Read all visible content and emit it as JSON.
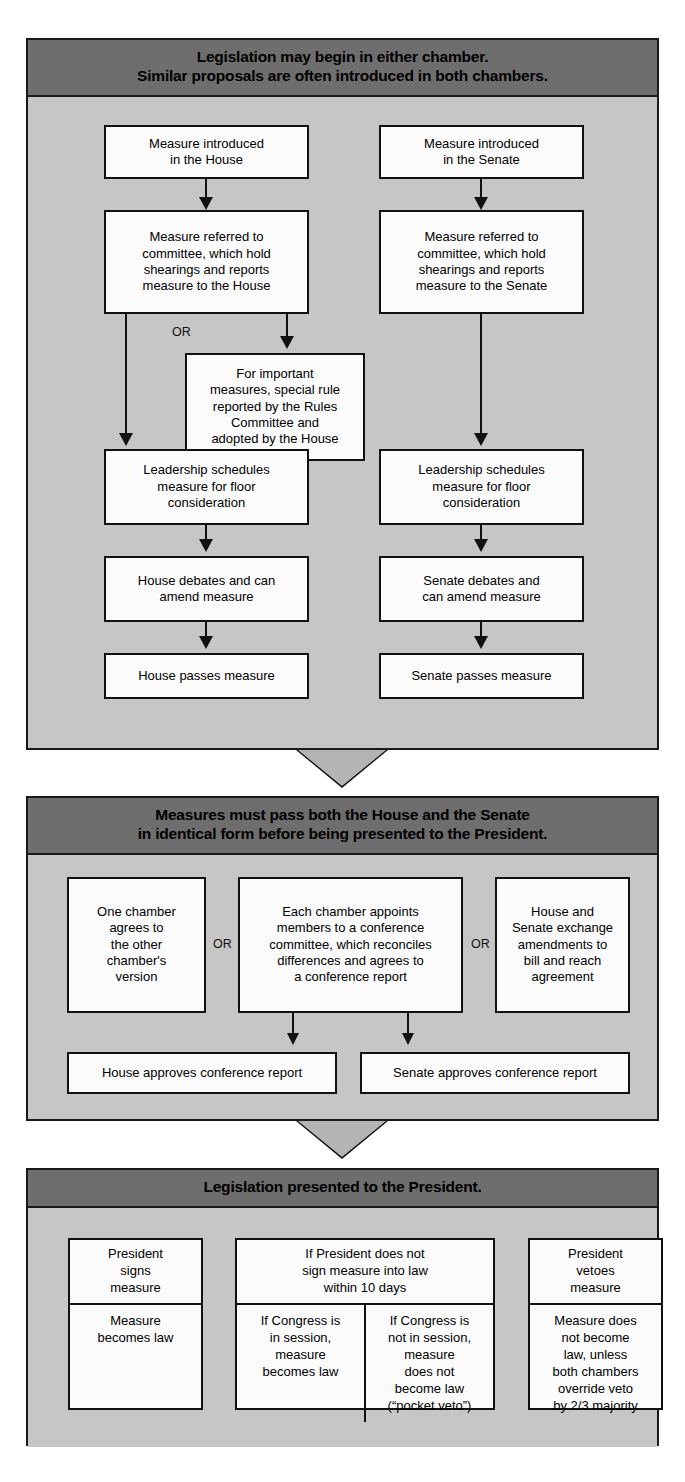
{
  "diagram": {
    "colors": {
      "header_bar": "#6e6e6e",
      "section_fill": "#c6c6c6",
      "box_fill": "#fbfbfb",
      "stroke": "#111111",
      "chevron_fill": "#b4b4b4"
    }
  },
  "sections": [
    {
      "id": "origination",
      "header_line1": "Legislation may begin in either chamber.",
      "header_line2": "Similar proposals are often introduced in both chambers.",
      "or_label": "OR",
      "house": {
        "step1": "Measure introduced\nin the House",
        "step2": "Measure referred to\ncommittee, which hold\nshearings and reports\nmeasure to the House",
        "step_rules": "For important\nmeasures, special rule\nreported by the Rules\nCommittee and\nadopted by the House",
        "step3": "Leadership schedules\nmeasure for floor\nconsideration",
        "step4": "House debates and can\namend measure",
        "step5": "House passes measure"
      },
      "senate": {
        "step1": "Measure introduced\nin the Senate",
        "step2": "Measure referred to\ncommittee, which hold\nshearings and reports\nmeasure to the Senate",
        "step3": "Leadership schedules\nmeasure for floor\nconsideration",
        "step4": "Senate debates and\ncan amend measure",
        "step5": "Senate passes measure"
      }
    },
    {
      "id": "reconciliation",
      "header_line1": "Measures must pass both the House and the Senate",
      "header_line2": "in identical form before being presented to the President.",
      "or_label_1": "OR",
      "or_label_2": "OR",
      "option1": "One chamber\nagrees to\nthe other\nchamber's\nversion",
      "option2": "Each chamber appoints\nmembers to a conference\ncommittee, which reconciles\ndifferences and agrees to\na conference report",
      "option3": "House and\nSenate exchange\namendments to\nbill and reach\nagreement",
      "house_approves": "House approves conference report",
      "senate_approves": "Senate approves conference report"
    },
    {
      "id": "presidential",
      "header_line1": "Legislation presented to the President.",
      "signs": {
        "top": "President\nsigns\nmeasure",
        "bottom": "Measure\nbecomes law"
      },
      "no_sign": {
        "top": "If President does not\nsign measure into law\nwithin 10 days",
        "bottom_left": "If Congress is\nin session,\nmeasure\nbecomes law",
        "bottom_right": "If Congress is\nnot in session,\nmeasure\ndoes not\nbecome law\n(“pocket veto”)"
      },
      "veto": {
        "top": "President\nvetoes\nmeasure",
        "bottom": "Measure does\nnot become\nlaw, unless\nboth chambers\noverride veto\nby 2/3 majority"
      }
    }
  ]
}
